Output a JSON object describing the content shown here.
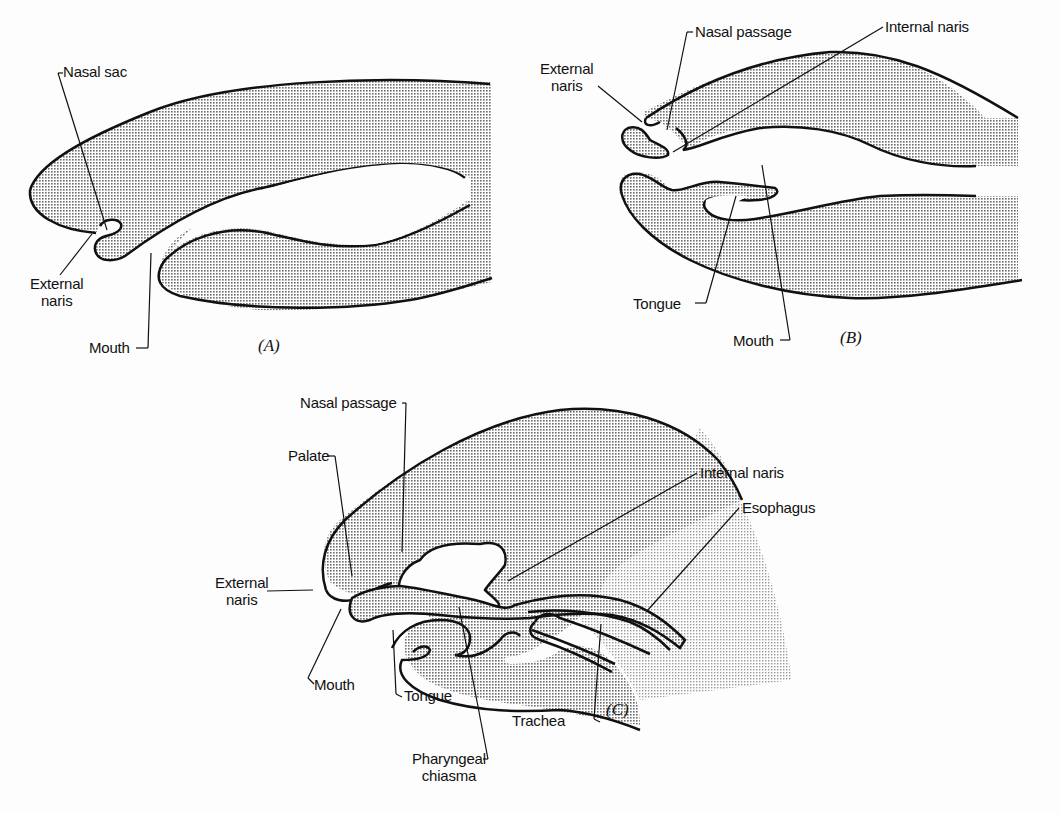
{
  "figure": {
    "panels": [
      {
        "id": "A",
        "label": "(A)",
        "annotations": {
          "nasal_sac": "Nasal sac",
          "external_naris_line1": "External",
          "external_naris_line2": "naris",
          "mouth": "Mouth"
        }
      },
      {
        "id": "B",
        "label": "(B)",
        "annotations": {
          "nasal_passage": "Nasal passage",
          "internal_naris": "Internal naris",
          "external_naris_line1": "External",
          "external_naris_line2": "naris",
          "tongue": "Tongue",
          "mouth": "Mouth"
        }
      },
      {
        "id": "C",
        "label": "(C)",
        "annotations": {
          "nasal_passage": "Nasal passage",
          "palate": "Palate",
          "internal_naris": "Internal naris",
          "esophagus": "Esophagus",
          "external_naris_line1": "External",
          "external_naris_line2": "naris",
          "mouth": "Mouth",
          "tongue": "Tongue",
          "trachea": "Trachea",
          "pharyngeal_chiasma_line1": "Pharyngeal",
          "pharyngeal_chiasma_line2": "chiasma"
        }
      }
    ],
    "colors": {
      "ink": "#111111",
      "stipple": "#8a8a8a",
      "background": "#fdfdfd"
    }
  }
}
